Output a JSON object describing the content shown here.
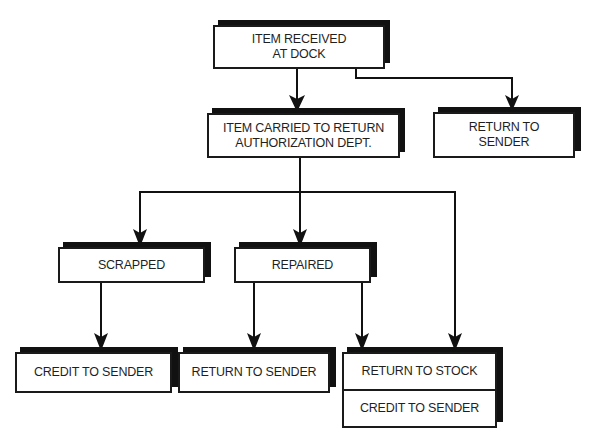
{
  "diagram": {
    "type": "flowchart",
    "nodes": {
      "received": {
        "lines": [
          "ITEM RECEIVED",
          "AT DOCK"
        ]
      },
      "carried": {
        "lines": [
          "ITEM CARRIED TO RETURN",
          "AUTHORIZATION DEPT."
        ]
      },
      "return_top": {
        "lines": [
          "RETURN TO",
          "SENDER"
        ]
      },
      "scrapped": {
        "lines": [
          "SCRAPPED"
        ]
      },
      "repaired": {
        "lines": [
          "REPAIRED"
        ]
      },
      "credit": {
        "lines": [
          "CREDIT TO SENDER"
        ]
      },
      "return_bottom": {
        "lines": [
          "RETURN TO SENDER"
        ]
      },
      "stock": {
        "lines": [
          "RETURN TO STOCK",
          "CREDIT TO SENDER"
        ]
      }
    },
    "edges": [
      {
        "from": "received",
        "to": "carried"
      },
      {
        "from": "received",
        "to": "return_top"
      },
      {
        "from": "carried",
        "to": "scrapped"
      },
      {
        "from": "carried",
        "to": "repaired"
      },
      {
        "from": "carried",
        "to": "stock"
      },
      {
        "from": "scrapped",
        "to": "credit"
      },
      {
        "from": "repaired",
        "to": "return_bottom"
      },
      {
        "from": "repaired",
        "to": "stock"
      }
    ],
    "colors": {
      "line": "#111111",
      "box_fill": "#ffffff",
      "text": "#1f1f1f"
    }
  }
}
